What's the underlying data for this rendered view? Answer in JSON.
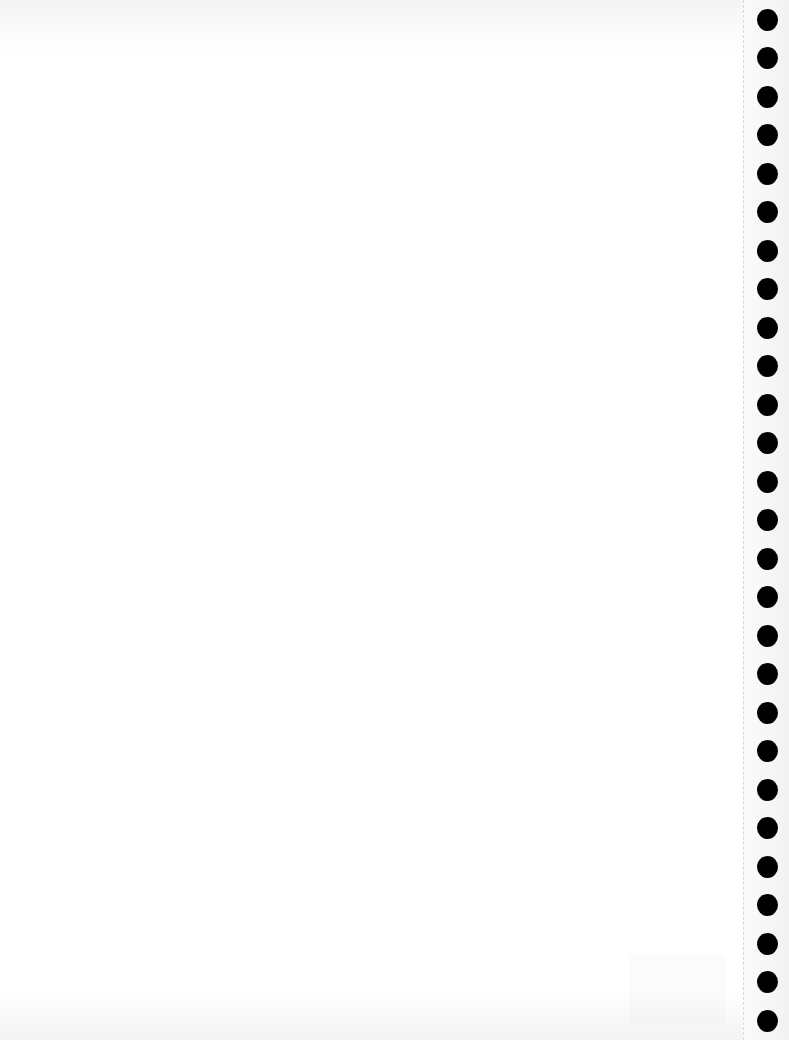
{
  "document": {
    "type": "blank scanned page",
    "content_text": "",
    "binder_holes": {
      "count": 27,
      "side": "right",
      "color": "#000000",
      "center_x": 767,
      "first_center_y": 19,
      "spacing_px": 38.5,
      "diameter_px": 21
    },
    "perforation_x": 743,
    "paper_color": "#ffffff"
  }
}
